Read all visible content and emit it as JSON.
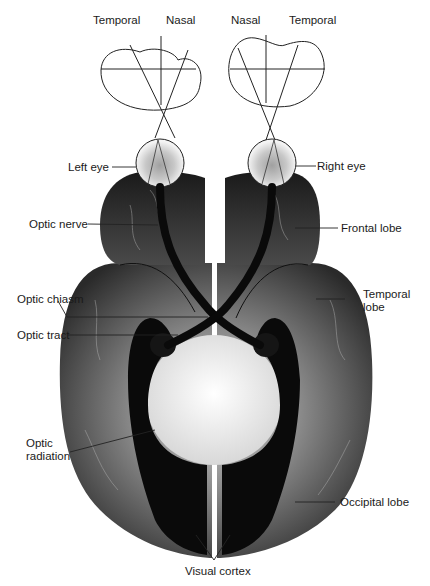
{
  "diagram": {
    "type": "anatomical"
  },
  "labels": {
    "temporal_left": "Temporal",
    "nasal_left": "Nasal",
    "nasal_right": "Nasal",
    "temporal_right": "Temporal",
    "left_eye": "Left eye",
    "right_eye": "Right eye",
    "optic_nerve": "Optic nerve",
    "frontal_lobe": "Frontal lobe",
    "optic_chiasm": "Optic chiasm",
    "temporal_lobe_1": "Temporal",
    "temporal_lobe_2": "lobe",
    "optic_tract": "Optic tract",
    "optic_radiation_1": "Optic",
    "optic_radiation_2": "radiation",
    "occipital_lobe": "Occipital lobe",
    "visual_cortex": "Visual cortex"
  },
  "colors": {
    "brain_dark": "#1e1e1e",
    "brain_mid": "#5a5a5a",
    "pathway": "#0a0a0a",
    "center_light": "#f4f4f4"
  }
}
